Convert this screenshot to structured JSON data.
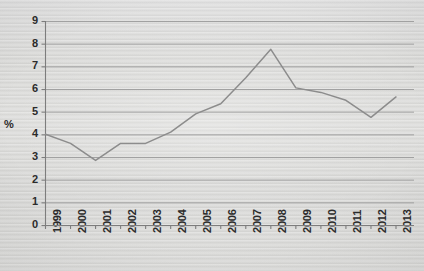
{
  "chart_data": {
    "type": "line",
    "title": "",
    "xlabel": "",
    "ylabel": "%",
    "categories": [
      "1999",
      "2000",
      "2001",
      "2002",
      "2003",
      "2004",
      "2005",
      "2006",
      "2007",
      "2008",
      "2009",
      "2010",
      "2011",
      "2012",
      "2013"
    ],
    "values": [
      4.0,
      3.6,
      2.85,
      3.6,
      3.6,
      4.1,
      4.9,
      5.35,
      6.5,
      7.75,
      6.05,
      5.85,
      5.5,
      4.75,
      5.65
    ],
    "series": [
      {
        "name": "",
        "values": [
          4.0,
          3.6,
          2.85,
          3.6,
          3.6,
          4.1,
          4.9,
          5.35,
          6.5,
          7.75,
          6.05,
          5.85,
          5.5,
          4.75,
          5.65
        ]
      }
    ],
    "ylim": [
      0,
      9
    ],
    "yticks": [
      0,
      1,
      2,
      3,
      4,
      5,
      6,
      7,
      8,
      9
    ],
    "ytick_labels": [
      "0",
      "1",
      "2",
      "3",
      "4",
      "5",
      "6",
      "7",
      "8",
      "9"
    ],
    "xtick_labels": [
      "1999",
      "2000",
      "2001",
      "2002",
      "2003",
      "2004",
      "2005",
      "2006",
      "2007",
      "2008",
      "2009",
      "2010",
      "2011",
      "2012",
      "2013"
    ],
    "grid": "horizontal",
    "legend": "none",
    "annotations": [],
    "colors": {
      "line": "#8c8c8c",
      "gridline": "#9a9a9a",
      "axis": "#7d7d7d",
      "background": "#d9d9d7",
      "text": "#2b2b2b"
    }
  }
}
